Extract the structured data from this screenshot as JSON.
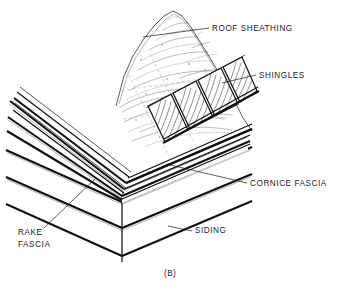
{
  "figure": {
    "caption": "(B)",
    "line_color": "#111111",
    "background_color": "#ffffff"
  },
  "labels": {
    "roof_sheathing": "ROOF SHEATHING",
    "shingles": "SHINGLES",
    "cornice_fascia": "CORNICE FASCIA",
    "rake_fascia_line1": "RAKE",
    "rake_fascia_line2": "FASCIA",
    "siding": "SIDING"
  },
  "callouts": [
    {
      "id": "roof-sheathing",
      "text": "ROOF SHEATHING",
      "text_x": 212,
      "text_y": 31,
      "leader_from_x": 209,
      "leader_from_y": 28,
      "leader_to_x": 143,
      "leader_to_y": 37
    },
    {
      "id": "shingles",
      "text": "SHINGLES",
      "text_x": 259,
      "text_y": 78,
      "leader_from_x": 256,
      "leader_from_y": 75,
      "leader_to_x": 222,
      "leader_to_y": 83
    },
    {
      "id": "cornice-fascia",
      "text": "CORNICE FASCIA",
      "text_x": 250,
      "text_y": 186,
      "leader_from_x": 247,
      "leader_from_y": 183,
      "leader_to_x": 166,
      "leader_to_y": 164
    },
    {
      "id": "siding",
      "text": "SIDING",
      "text_x": 195,
      "text_y": 233,
      "leader_from_x": 192,
      "leader_from_y": 231,
      "leader_to_x": 168,
      "leader_to_y": 226
    },
    {
      "id": "rake-fascia",
      "text": "RAKE FASCIA",
      "text_x": 18,
      "text_y": 235,
      "leader_from_x": 44,
      "leader_from_y": 228,
      "leader_to_x": 77,
      "leader_to_y": 195
    }
  ]
}
